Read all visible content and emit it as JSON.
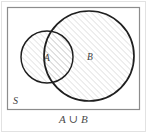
{
  "figure": {
    "type": "venn-diagram",
    "caption": "A ∪ B",
    "universe_label": "S",
    "sets": [
      {
        "id": "A",
        "label": "A",
        "label_x": 47,
        "label_y": 58,
        "center_x": 47,
        "center_y": 57,
        "radius": 26,
        "shaded": true
      },
      {
        "id": "B",
        "label": "B",
        "label_x": 90,
        "label_y": 57,
        "center_x": 89,
        "center_y": 56,
        "radius": 45,
        "shaded": true
      }
    ],
    "universe_rect": {
      "x": 7,
      "y": 7,
      "width": 133,
      "height": 103,
      "label_x": 13,
      "label_y": 102
    },
    "colors": {
      "background": "#ffffff",
      "rect_stroke": "#8c8c8c",
      "outer_frame": "#e2e2e2",
      "circle_stroke": "#1f1f1f",
      "hatch_stroke": "#bdbdbd",
      "label_text": "#3d3d3d",
      "caption_text": "#4a4a4a"
    },
    "hatch": {
      "angle_degrees": 45,
      "spacing_px": 3,
      "line_width": 0.6
    }
  }
}
